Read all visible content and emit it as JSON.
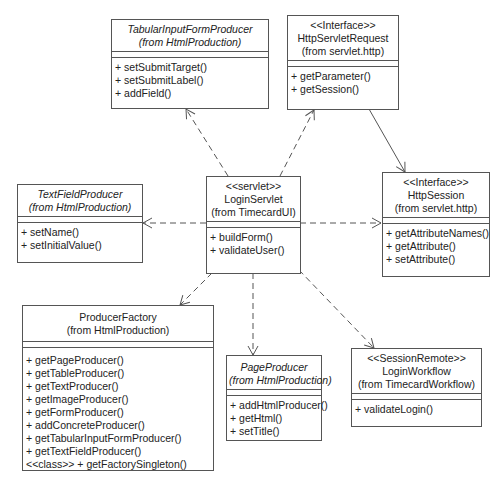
{
  "diagram": {
    "type": "UML class diagram",
    "classes": {
      "tabular": {
        "stereotype": "",
        "name": "TabularInputFormProducer",
        "package": "(from HtmlProduction)",
        "abstract": true,
        "operations": [
          "+ setSubmitTarget()",
          "+ setSubmitLabel()",
          "+ addField()"
        ]
      },
      "request": {
        "stereotype": "<<Interface>>",
        "name": "HttpServletRequest",
        "package": "(from servlet.http)",
        "abstract": false,
        "operations": [
          "+ getParameter()",
          "+ getSession()"
        ]
      },
      "textfield": {
        "stereotype": "",
        "name": "TextFieldProducer",
        "package": "(from HtmlProduction)",
        "abstract": true,
        "operations": [
          "+ setName()",
          "+ setInitialValue()"
        ]
      },
      "servlet": {
        "stereotype": "<<servlet>>",
        "name": "LoginServlet",
        "package": "(from TimecardUI)",
        "abstract": false,
        "operations": [
          "+ buildForm()",
          "+ validateUser()"
        ]
      },
      "session": {
        "stereotype": "<<Interface>>",
        "name": "HttpSession",
        "package": "(from servlet.http)",
        "abstract": false,
        "operations": [
          "+ getAttributeNames()",
          "+ getAttribute()",
          "+ setAttribute()"
        ]
      },
      "factory": {
        "stereotype": "",
        "name": "ProducerFactory",
        "package": "(from HtmlProduction)",
        "abstract": false,
        "operations": [
          "+ getPageProducer()",
          "+ getTableProducer()",
          "+ getTextProducer()",
          "+ getImageProducer()",
          "+ getFormProducer()",
          "+ addConcreteProducer()",
          "+ getTabularInputFormProducer()",
          "+ getTextFieldProducer()",
          "<<class>> + getFactorySingleton()"
        ]
      },
      "page": {
        "stereotype": "",
        "name": "PageProducer",
        "package": "(from HtmlProduction)",
        "abstract": true,
        "operations": [
          "+ addHtmlProducer()",
          "+ getHtml()",
          "+ setTitle()"
        ]
      },
      "workflow": {
        "stereotype": "<<SessionRemote>>",
        "name": "LoginWorkflow",
        "package": "(from TimecardWorkflow)",
        "abstract": false,
        "operations": [
          "+ validateLogin()"
        ]
      }
    },
    "relationships": [
      {
        "from": "LoginServlet",
        "to": "TabularInputFormProducer",
        "kind": "dependency"
      },
      {
        "from": "LoginServlet",
        "to": "HttpServletRequest",
        "kind": "dependency"
      },
      {
        "from": "LoginServlet",
        "to": "TextFieldProducer",
        "kind": "dependency"
      },
      {
        "from": "LoginServlet",
        "to": "HttpSession",
        "kind": "dependency"
      },
      {
        "from": "LoginServlet",
        "to": "ProducerFactory",
        "kind": "dependency"
      },
      {
        "from": "LoginServlet",
        "to": "PageProducer",
        "kind": "dependency"
      },
      {
        "from": "LoginServlet",
        "to": "LoginWorkflow",
        "kind": "dependency"
      },
      {
        "from": "HttpServletRequest",
        "to": "HttpSession",
        "kind": "association"
      }
    ],
    "colors": {
      "line": "#555555",
      "background": "#ffffff",
      "text": "#222222"
    }
  }
}
